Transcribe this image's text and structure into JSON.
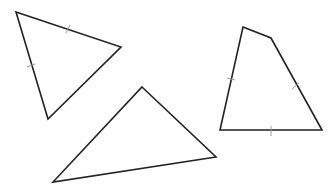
{
  "figure": {
    "width": 333,
    "height": 193,
    "background": "#ffffff",
    "stroke_color": "#222222",
    "tick_color": "#9a9a9a",
    "shapes": [
      {
        "name": "triangle-top-left",
        "type": "triangle",
        "points": "16,12 121,47 48,119",
        "ticks": [
          {
            "x1": 66,
            "y1": 33,
            "x2": 70,
            "y2": 25
          },
          {
            "x1": 27,
            "y1": 67,
            "x2": 35,
            "y2": 64
          }
        ]
      },
      {
        "name": "triangle-bottom",
        "type": "triangle",
        "points": "142,87 216,157 53,182",
        "ticks": []
      },
      {
        "name": "quadrilateral-right",
        "type": "quadrilateral",
        "points": "243,27 271,38 322,130 220,130",
        "ticks": [
          {
            "x1": 227,
            "y1": 78,
            "x2": 235,
            "y2": 80
          },
          {
            "x1": 292,
            "y1": 89,
            "x2": 299,
            "y2": 83
          },
          {
            "x1": 271,
            "y1": 126,
            "x2": 271,
            "y2": 136
          }
        ]
      }
    ]
  }
}
